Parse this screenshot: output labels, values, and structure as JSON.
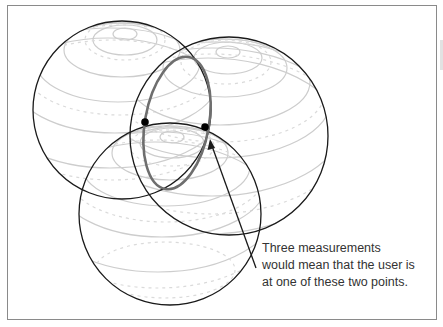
{
  "figure": {
    "caption_lines": [
      "Three measurements",
      "would mean that the user is",
      "at one of these two points."
    ],
    "colors": {
      "outline": "#1a1a1a",
      "latitude": "#c8c8c8",
      "intersection_ring": "#6e6e6e",
      "point": "#000000",
      "frame": "#8a8a8a",
      "text": "#333333"
    },
    "spheres": [
      {
        "name": "sphere-left",
        "cx": 122,
        "cy": 110,
        "r": 89
      },
      {
        "name": "sphere-right",
        "cx": 229,
        "cy": 136,
        "r": 99
      },
      {
        "name": "sphere-bottom",
        "cx": 170,
        "cy": 214,
        "r": 91
      }
    ],
    "intersection_ring": {
      "cx": 177,
      "cy": 123,
      "rx": 32,
      "ry": 67,
      "rotate": 10
    },
    "points": [
      {
        "x": 145,
        "y": 122
      },
      {
        "x": 205,
        "y": 127
      }
    ],
    "arrow": {
      "from": [
        256,
        268
      ],
      "to": [
        210,
        140
      ]
    }
  }
}
